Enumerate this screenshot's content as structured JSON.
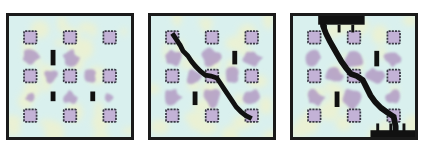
{
  "figure": {
    "panel_count": 3,
    "background_color": "#ffffff"
  },
  "colors": {
    "matrix_background": "#d9f0ee",
    "matrix_highlight": "#f5f2c4",
    "damage_blob": "#b39cc4",
    "inclusion_fill": "#c3b2d6",
    "inclusion_border": "#3a3a46",
    "crack_black": "#111111",
    "panel_border": "#1a1a1a"
  },
  "panels": [
    {
      "id": "panel-1",
      "label": "stage-1-initial-microcracks",
      "description": "Undamaged matrix with nine square inclusions and three short vertical microcracks; no connected crack path.",
      "inclusions": [
        {
          "cx": 22,
          "cy": 22
        },
        {
          "cx": 63,
          "cy": 22
        },
        {
          "cx": 104,
          "cy": 22
        },
        {
          "cx": 22,
          "cy": 62
        },
        {
          "cx": 63,
          "cy": 62
        },
        {
          "cx": 104,
          "cy": 62
        },
        {
          "cx": 22,
          "cy": 103
        },
        {
          "cx": 63,
          "cy": 103
        },
        {
          "cx": 104,
          "cy": 103
        }
      ],
      "microcracks": [
        {
          "x": 43,
          "y": 35,
          "w": 5,
          "h": 16
        },
        {
          "x": 43,
          "y": 78,
          "w": 5,
          "h": 10
        },
        {
          "x": 84,
          "y": 78,
          "w": 5,
          "h": 10
        }
      ],
      "crack_path": "",
      "blobs": [
        {
          "cx": 22,
          "cy": 43,
          "r": 8
        },
        {
          "cx": 63,
          "cy": 43,
          "r": 8
        },
        {
          "cx": 43,
          "cy": 62,
          "r": 7
        },
        {
          "cx": 84,
          "cy": 62,
          "r": 7
        },
        {
          "cx": 22,
          "cy": 84,
          "r": 5
        },
        {
          "cx": 63,
          "cy": 84,
          "r": 7
        },
        {
          "cx": 104,
          "cy": 84,
          "r": 5
        }
      ]
    },
    {
      "id": "panel-2",
      "label": "stage-2-crack-coalescence",
      "description": "A single stepped crack runs diagonally from the top-left inclusion through the centre inclusion to the bottom-right inclusion.",
      "inclusions": [
        {
          "cx": 22,
          "cy": 22
        },
        {
          "cx": 63,
          "cy": 22
        },
        {
          "cx": 104,
          "cy": 22
        },
        {
          "cx": 22,
          "cy": 62
        },
        {
          "cx": 63,
          "cy": 62
        },
        {
          "cx": 104,
          "cy": 62
        },
        {
          "cx": 22,
          "cy": 103
        },
        {
          "cx": 63,
          "cy": 103
        },
        {
          "cx": 104,
          "cy": 103
        }
      ],
      "microcracks": [
        {
          "x": 84,
          "y": 36,
          "w": 5,
          "h": 14
        },
        {
          "x": 43,
          "y": 78,
          "w": 5,
          "h": 14
        }
      ],
      "crack_path": "M 22 18 L 26 24 L 30 30 L 33 36 L 38 41 L 42 47 L 46 52 L 51 57 L 56 61 L 62 62 L 68 64 L 72 70 L 76 76 L 80 82 L 84 88 L 88 94 L 93 99 L 98 103 L 104 106",
      "crack_width": 5,
      "blobs": [
        {
          "cx": 22,
          "cy": 43,
          "r": 9
        },
        {
          "cx": 63,
          "cy": 43,
          "r": 10
        },
        {
          "cx": 104,
          "cy": 43,
          "r": 9
        },
        {
          "cx": 43,
          "cy": 62,
          "r": 8
        },
        {
          "cx": 84,
          "cy": 62,
          "r": 8
        },
        {
          "cx": 22,
          "cy": 84,
          "r": 9
        },
        {
          "cx": 63,
          "cy": 84,
          "r": 10
        },
        {
          "cx": 104,
          "cy": 84,
          "r": 8
        }
      ]
    },
    {
      "id": "panel-3",
      "label": "stage-3-through-crack",
      "description": "The crack has widened and propagated fully through the specimen, breaking the top edge and the bottom edge.",
      "inclusions": [
        {
          "cx": 22,
          "cy": 22
        },
        {
          "cx": 63,
          "cy": 22
        },
        {
          "cx": 104,
          "cy": 22
        },
        {
          "cx": 22,
          "cy": 62
        },
        {
          "cx": 63,
          "cy": 62
        },
        {
          "cx": 104,
          "cy": 62
        },
        {
          "cx": 22,
          "cy": 103
        },
        {
          "cx": 63,
          "cy": 103
        },
        {
          "cx": 104,
          "cy": 103
        }
      ],
      "microcracks": [
        {
          "x": 84,
          "y": 36,
          "w": 5,
          "h": 16
        },
        {
          "x": 43,
          "y": 78,
          "w": 5,
          "h": 16
        }
      ],
      "crack_path": "M 31 -4 L 31 10 L 34 18 L 38 26 L 42 33 L 46 40 L 50 47 L 55 54 L 60 60 L 66 62 L 72 66 L 76 74 L 80 82 L 85 89 L 91 95 L 98 100 L 104 104 L 106 114 L 106 130",
      "crack_width": 6,
      "edge_breaks": {
        "top": {
          "x": 26,
          "y": 0,
          "w": 48,
          "h": 9
        },
        "bottom": {
          "x": 80,
          "y": 118,
          "w": 46,
          "h": 9
        }
      },
      "blobs": [
        {
          "cx": 22,
          "cy": 43,
          "r": 9
        },
        {
          "cx": 63,
          "cy": 43,
          "r": 11
        },
        {
          "cx": 104,
          "cy": 43,
          "r": 9
        },
        {
          "cx": 43,
          "cy": 62,
          "r": 9
        },
        {
          "cx": 84,
          "cy": 62,
          "r": 9
        },
        {
          "cx": 22,
          "cy": 84,
          "r": 9
        },
        {
          "cx": 63,
          "cy": 84,
          "r": 11
        },
        {
          "cx": 104,
          "cy": 84,
          "r": 8
        }
      ]
    }
  ]
}
